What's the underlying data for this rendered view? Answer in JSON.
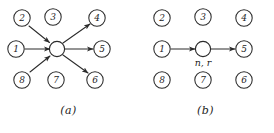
{
  "figure": {
    "background_color": "#ffffff",
    "ink_color": "#2b2b2b",
    "panels": [
      {
        "id": "a",
        "caption": "(a)",
        "center_node": {
          "label": "",
          "annotation": ""
        },
        "neighbors": [
          {
            "id": "n2",
            "label": "2",
            "position": "top-left",
            "cx": 22,
            "cy": 18,
            "edge": "incoming"
          },
          {
            "id": "n3",
            "label": "3",
            "position": "top-center",
            "cx": 53,
            "cy": 17,
            "edge": "none"
          },
          {
            "id": "n4",
            "label": "4",
            "position": "top-right",
            "cx": 97,
            "cy": 18,
            "edge": "outgoing"
          },
          {
            "id": "n1",
            "label": "1",
            "position": "middle-left",
            "cx": 16,
            "cy": 49,
            "edge": "incoming"
          },
          {
            "id": "n5",
            "label": "5",
            "position": "middle-right",
            "cx": 102,
            "cy": 49,
            "edge": "outgoing"
          },
          {
            "id": "n8",
            "label": "8",
            "position": "bottom-left",
            "cx": 22,
            "cy": 80,
            "edge": "incoming"
          },
          {
            "id": "n7",
            "label": "7",
            "position": "bottom-center",
            "cx": 56,
            "cy": 80,
            "edge": "none"
          },
          {
            "id": "n6",
            "label": "6",
            "position": "bottom-right",
            "cx": 95,
            "cy": 80,
            "edge": "outgoing"
          }
        ]
      },
      {
        "id": "b",
        "caption": "(b)",
        "center_node": {
          "label": "",
          "annotation": "n, r"
        },
        "neighbors": [
          {
            "id": "n2",
            "label": "2",
            "position": "top-left",
            "cx": 25,
            "cy": 18,
            "edge": "none"
          },
          {
            "id": "n3",
            "label": "3",
            "position": "top-center",
            "cx": 66,
            "cy": 17,
            "edge": "none"
          },
          {
            "id": "n4",
            "label": "4",
            "position": "top-right",
            "cx": 107,
            "cy": 18,
            "edge": "none"
          },
          {
            "id": "n1",
            "label": "1",
            "position": "middle-left",
            "cx": 25,
            "cy": 49,
            "edge": "incoming"
          },
          {
            "id": "n5",
            "label": "5",
            "position": "middle-right",
            "cx": 107,
            "cy": 49,
            "edge": "outgoing"
          },
          {
            "id": "n8",
            "label": "8",
            "position": "bottom-left",
            "cx": 25,
            "cy": 80,
            "edge": "none"
          },
          {
            "id": "n7",
            "label": "7",
            "position": "bottom-center",
            "cx": 66,
            "cy": 80,
            "edge": "none"
          },
          {
            "id": "n6",
            "label": "6",
            "position": "bottom-right",
            "cx": 107,
            "cy": 80,
            "edge": "none"
          }
        ]
      }
    ]
  }
}
